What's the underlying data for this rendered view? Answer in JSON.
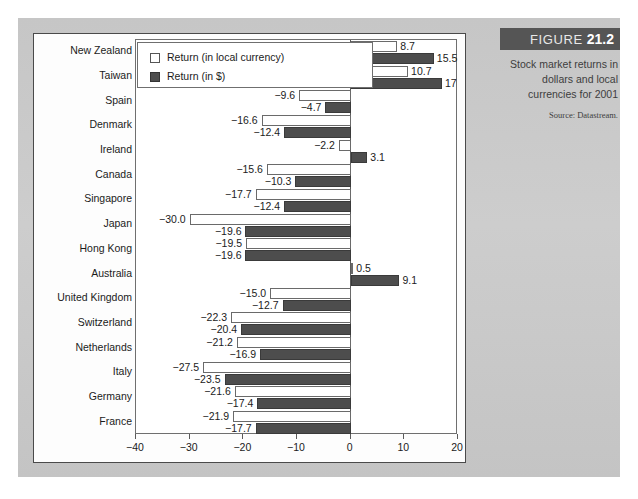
{
  "figure": {
    "label_word": "FIGURE",
    "number": "21.2",
    "caption": "Stock market returns in dollars and local currencies for 2001",
    "source": "Source: Datastream."
  },
  "legend": {
    "items": [
      {
        "label": "Return (in local currency)",
        "swatch": "white-square-icon",
        "color": "#ffffff"
      },
      {
        "label": "Return (in $)",
        "swatch": "dark-square-icon",
        "color": "#4d4d4d"
      }
    ]
  },
  "axis": {
    "ticks": [
      -40,
      -30,
      -20,
      -10,
      0,
      10,
      20
    ],
    "tick_labels": [
      "-40",
      "-30",
      "-20",
      "-10",
      "0",
      "10",
      "20"
    ]
  },
  "chart_data": {
    "type": "bar",
    "orientation": "horizontal",
    "title": "Stock market returns in dollars and local currencies for 2001",
    "xlabel": "",
    "ylabel": "",
    "xlim": [
      -40,
      20
    ],
    "grid": false,
    "legend_position": "top-left-inside",
    "categories": [
      "New Zealand",
      "Taiwan",
      "Spain",
      "Denmark",
      "Ireland",
      "Canada",
      "Singapore",
      "Japan",
      "Hong Kong",
      "Australia",
      "United Kingdom",
      "Switzerland",
      "Netherlands",
      "Italy",
      "Germany",
      "France"
    ],
    "series": [
      {
        "name": "Return (in local currency)",
        "color": "#ffffff",
        "values": [
          8.7,
          10.7,
          -9.6,
          -16.6,
          -2.2,
          -15.6,
          -17.7,
          -30.0,
          -19.5,
          0.5,
          -15.0,
          -22.3,
          -21.2,
          -27.5,
          -21.6,
          -21.9
        ],
        "labels": [
          "8.7",
          "10.7",
          "-9.6",
          "-16.6",
          "-2.2",
          "-15.6",
          "-17.7",
          "-30.0",
          "-19.5",
          "0.5",
          "-15.0",
          "-22.3",
          "-21.2",
          "-27.5",
          "-21.6",
          "-21.9"
        ]
      },
      {
        "name": "Return (in $)",
        "color": "#4d4d4d",
        "values": [
          15.5,
          17,
          -4.7,
          -12.4,
          3.1,
          -10.3,
          -12.4,
          -19.6,
          -19.6,
          9.1,
          -12.7,
          -20.4,
          -16.9,
          -23.5,
          -17.4,
          -17.7
        ],
        "labels": [
          "15.5",
          "17",
          "-4.7",
          "-12.4",
          "3.1",
          "-10.3",
          "-12.4",
          "-19.6",
          "-19.6",
          "9.1",
          "-12.7",
          "-20.4",
          "-16.9",
          "-23.5",
          "-17.4",
          "-17.7"
        ]
      }
    ]
  }
}
